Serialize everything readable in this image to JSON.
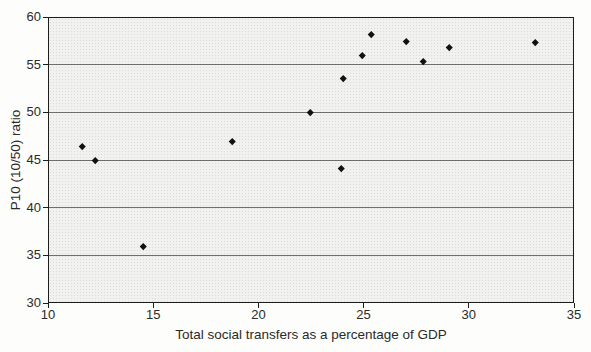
{
  "chart_data": {
    "type": "scatter",
    "title": "",
    "xlabel": "Total social transfers as a percentage of GDP",
    "ylabel": "P10 (10/50) ratio",
    "xlim": [
      10,
      35
    ],
    "ylim": [
      30,
      60
    ],
    "x_ticks": [
      10,
      15,
      20,
      25,
      30,
      35
    ],
    "y_ticks": [
      30,
      35,
      40,
      45,
      50,
      55,
      60
    ],
    "grid": "horizontal-only",
    "legend": "none",
    "marker": "diamond",
    "points": [
      {
        "x": 11.6,
        "y": 46.5
      },
      {
        "x": 12.2,
        "y": 45.1
      },
      {
        "x": 14.5,
        "y": 36.1
      },
      {
        "x": 18.7,
        "y": 47.1
      },
      {
        "x": 22.4,
        "y": 50.1
      },
      {
        "x": 23.9,
        "y": 44.2
      },
      {
        "x": 24.0,
        "y": 53.7
      },
      {
        "x": 24.9,
        "y": 56.1
      },
      {
        "x": 25.3,
        "y": 58.3
      },
      {
        "x": 27.0,
        "y": 57.6
      },
      {
        "x": 27.8,
        "y": 55.5
      },
      {
        "x": 29.0,
        "y": 56.9
      },
      {
        "x": 33.1,
        "y": 57.5
      }
    ],
    "colors": {
      "marker": "#111111",
      "grid_line": "#6e6e6e",
      "plot_border": "#1d1d1d",
      "plot_bg": "#f1f1ef",
      "page_bg": "#fdfdfc",
      "text": "#2a2a2a"
    }
  }
}
